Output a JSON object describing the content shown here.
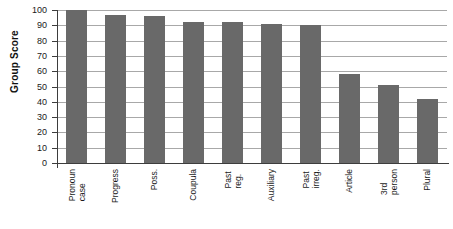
{
  "chart_data": {
    "type": "bar",
    "title": "",
    "subtitle": "",
    "xlabel": "",
    "ylabel": "Group Score",
    "ylim": [
      0,
      100
    ],
    "ytick_step": 10,
    "yticks": [
      100,
      90,
      80,
      70,
      60,
      50,
      40,
      30,
      20,
      10,
      0
    ],
    "grid": "horizontal",
    "legend": "none",
    "bar_color": "#696969",
    "categories": [
      "Pronoun\ncase",
      "Progress",
      "Poss.",
      "Coupula",
      "Past reg.",
      "Auxiliary",
      "Past irreg.",
      "Article",
      "3rd person",
      "Plural"
    ],
    "values": [
      100,
      97,
      96,
      92,
      92,
      91,
      90,
      58,
      51,
      42
    ]
  }
}
